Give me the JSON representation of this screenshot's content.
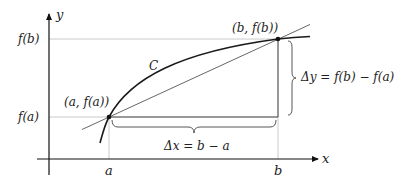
{
  "diagram": {
    "axes": {
      "x_label": "x",
      "y_label": "y"
    },
    "tick_labels": {
      "x_a": "a",
      "x_b": "b",
      "y_fa": "f(a)",
      "y_fb": "f(b)"
    },
    "points": {
      "A_label": "(a, f(a))",
      "B_label": "(b, f(b))"
    },
    "curve_label": "C",
    "delta_x_label": "Δx = b − a",
    "delta_y_label": "Δy = f(b) − f(a)",
    "colors": {
      "curve": "#1a1a1a",
      "secant": "#555555",
      "guide": "#b0b0b0",
      "axis": "#111111"
    }
  }
}
